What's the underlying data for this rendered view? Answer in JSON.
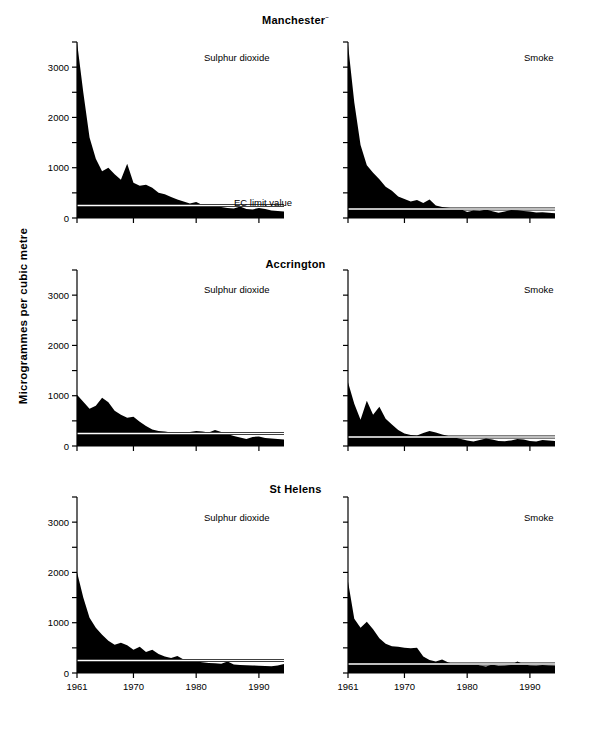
{
  "figure": {
    "y_axis_title": "Microgrammes per cubic metre",
    "annotation": "EC limit value",
    "series_labels": {
      "left": "Sulphur dioxide",
      "right": "Smoke"
    },
    "colors": {
      "area": "#000000",
      "axis": "#000000",
      "limit_line": "#000000",
      "limit_line_inner": "#ffffff",
      "background": "#ffffff"
    }
  },
  "rows": [
    {
      "title": "Manchester",
      "superscript": "~"
    },
    {
      "title": "Accrington",
      "superscript": ""
    },
    {
      "title": "St Helens",
      "superscript": ""
    }
  ],
  "chart_data": {
    "type": "area",
    "xlabel": "",
    "ylabel": "Microgrammes per cubic metre",
    "xlim": [
      1961,
      1994
    ],
    "ylim": [
      0,
      3500
    ],
    "yticks": [
      0,
      500,
      1000,
      1500,
      2000,
      2500,
      3000,
      3500
    ],
    "ytick_labels": [
      "0",
      "",
      "1000",
      "",
      "2000",
      "",
      "3000",
      ""
    ],
    "xticks": [
      1961,
      1970,
      1980,
      1990
    ],
    "xtick_labels": [
      "1961",
      "1970",
      "1980",
      "1990"
    ],
    "grid": false,
    "legend": "none",
    "annotations": [
      {
        "text": "EC limit value",
        "panel": "Manchester / Sulphur dioxide",
        "value": 250
      }
    ],
    "reference_lines": [
      {
        "label": "EC limit value",
        "pollutant": "Sulphur dioxide",
        "value": 250
      },
      {
        "label": "EC limit value",
        "pollutant": "Smoke",
        "value": 180
      }
    ],
    "x": [
      1961,
      1962,
      1963,
      1964,
      1965,
      1966,
      1967,
      1968,
      1969,
      1970,
      1971,
      1972,
      1973,
      1974,
      1975,
      1976,
      1977,
      1978,
      1979,
      1980,
      1981,
      1982,
      1983,
      1984,
      1985,
      1986,
      1987,
      1988,
      1989,
      1990,
      1991,
      1992,
      1993,
      1994
    ],
    "panels": [
      {
        "town": "Manchester",
        "pollutant": "Sulphur dioxide",
        "limit_value": 250,
        "values": [
          3520,
          2500,
          1600,
          1180,
          930,
          1000,
          870,
          760,
          1080,
          700,
          640,
          660,
          600,
          500,
          470,
          420,
          370,
          330,
          290,
          320,
          260,
          250,
          230,
          220,
          200,
          190,
          230,
          180,
          170,
          200,
          180,
          150,
          140,
          130
        ]
      },
      {
        "town": "Manchester",
        "pollutant": "Smoke",
        "limit_value": 180,
        "values": [
          3450,
          2300,
          1450,
          1050,
          900,
          770,
          620,
          540,
          430,
          380,
          330,
          360,
          300,
          370,
          250,
          220,
          205,
          190,
          175,
          120,
          150,
          140,
          170,
          135,
          105,
          130,
          160,
          155,
          140,
          130,
          110,
          115,
          105,
          95
        ]
      },
      {
        "town": "Accrington",
        "pollutant": "Sulphur dioxide",
        "limit_value": 250,
        "values": [
          1020,
          880,
          740,
          800,
          960,
          870,
          700,
          620,
          560,
          580,
          480,
          400,
          330,
          300,
          290,
          270,
          265,
          260,
          280,
          300,
          290,
          270,
          320,
          280,
          240,
          200,
          170,
          140,
          180,
          190,
          160,
          150,
          140,
          130
        ]
      },
      {
        "town": "Accrington",
        "pollutant": "Smoke",
        "limit_value": 180,
        "values": [
          1270,
          840,
          520,
          900,
          620,
          780,
          540,
          430,
          320,
          250,
          220,
          210,
          260,
          300,
          270,
          230,
          200,
          170,
          140,
          110,
          90,
          120,
          150,
          130,
          100,
          95,
          110,
          140,
          130,
          100,
          90,
          120,
          110,
          100
        ]
      },
      {
        "town": "St Helens",
        "pollutant": "Sulphur dioxide",
        "limit_value": 250,
        "values": [
          2010,
          1500,
          1100,
          900,
          760,
          640,
          560,
          600,
          550,
          460,
          520,
          420,
          460,
          380,
          330,
          300,
          340,
          270,
          250,
          230,
          215,
          200,
          195,
          185,
          230,
          170,
          160,
          155,
          150,
          145,
          140,
          135,
          150,
          180
        ]
      },
      {
        "town": "St Helens",
        "pollutant": "Smoke",
        "limit_value": 180,
        "values": [
          1820,
          1080,
          900,
          1020,
          870,
          690,
          580,
          530,
          520,
          500,
          490,
          500,
          330,
          260,
          230,
          270,
          210,
          180,
          160,
          170,
          200,
          150,
          130,
          170,
          140,
          145,
          160,
          230,
          175,
          150,
          145,
          160,
          150,
          145
        ]
      }
    ]
  }
}
